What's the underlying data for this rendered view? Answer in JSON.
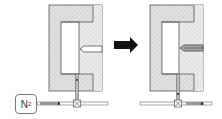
{
  "diagram": {
    "title": "",
    "gas_source": {
      "label": "N",
      "subscript": "2"
    },
    "states": [
      {
        "name": "before",
        "pin": "retracted",
        "gas_line": "filled-left"
      },
      {
        "name": "after",
        "pin": "extended",
        "gas_line": "filled-right"
      }
    ],
    "transition": {
      "icon": "arrow-right-icon"
    },
    "colors": {
      "hatch": "#cfcfcf",
      "outline": "#555555",
      "arrow": "#111111",
      "pipe_fill": "#999999"
    }
  }
}
